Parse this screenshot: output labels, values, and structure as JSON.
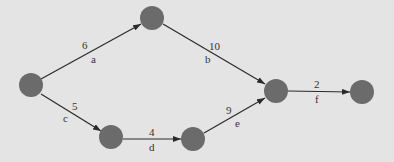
{
  "colors": {
    "background": "#e4e4e4",
    "node": "#6b6b6b",
    "edge": "#2a2a2a",
    "text": "#333333"
  },
  "nodes": [
    {
      "id": "n1",
      "x": 31,
      "y": 85
    },
    {
      "id": "n2",
      "x": 152,
      "y": 18
    },
    {
      "id": "n3",
      "x": 111,
      "y": 137
    },
    {
      "id": "n4",
      "x": 193,
      "y": 139
    },
    {
      "id": "n5",
      "x": 276,
      "y": 91
    },
    {
      "id": "n6",
      "x": 362,
      "y": 92
    }
  ],
  "edges": [
    {
      "from": "n1",
      "to": "n2",
      "weight": "6",
      "label": "a"
    },
    {
      "from": "n2",
      "to": "n5",
      "weight": "10",
      "label": "b"
    },
    {
      "from": "n1",
      "to": "n3",
      "weight": "5",
      "label": "c"
    },
    {
      "from": "n3",
      "to": "n4",
      "weight": "4",
      "label": "d"
    },
    {
      "from": "n4",
      "to": "n5",
      "weight": "9",
      "label": "e"
    },
    {
      "from": "n5",
      "to": "n6",
      "weight": "2",
      "label": "f"
    }
  ]
}
